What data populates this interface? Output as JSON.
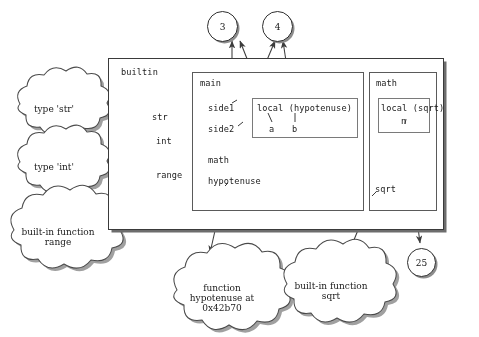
{
  "diagram": {
    "ink_color": "#1a1a1a",
    "frame_border_color": "#3a3a3a",
    "shadow_color": "#6d6d6d"
  },
  "frames": {
    "builtin": {
      "name": "builtin",
      "variables": [
        {
          "name": "str",
          "target": "type-str-cloud"
        },
        {
          "name": "int",
          "target": "type-int-cloud"
        },
        {
          "name": "range",
          "target": "builtin-function-range-cloud"
        }
      ]
    },
    "main": {
      "name": "main",
      "variables": [
        {
          "name": "side1",
          "target": "value-3"
        },
        {
          "name": "side2",
          "target": "value-4"
        },
        {
          "name": "math",
          "target": "math-frame"
        },
        {
          "name": "hypotenuse",
          "target": "function-hypotenuse-cloud"
        }
      ],
      "inner_frame": {
        "name": "local (hypotenuse)",
        "variables": [
          {
            "name": "a",
            "target": "value-3"
          },
          {
            "name": "b",
            "target": "value-4"
          }
        ]
      }
    },
    "math": {
      "name": "math",
      "variables": [
        {
          "name": "sqrt",
          "target": "builtin-function-sqrt-cloud"
        }
      ],
      "inner_frame": {
        "name": "local (sqrt)",
        "variables": [
          {
            "name": "n",
            "target": "value-25"
          }
        ]
      }
    }
  },
  "clouds": [
    {
      "id": "type-str-cloud",
      "lines": [
        "type 'str'"
      ]
    },
    {
      "id": "type-int-cloud",
      "lines": [
        "type 'int'"
      ]
    },
    {
      "id": "builtin-function-range-cloud",
      "lines": [
        "built-in function",
        "range"
      ]
    },
    {
      "id": "function-hypotenuse-cloud",
      "lines": [
        "function",
        "hypotenuse at",
        "0x42b70"
      ]
    },
    {
      "id": "builtin-function-sqrt-cloud",
      "lines": [
        "built-in function",
        "sqrt"
      ]
    }
  ],
  "values": [
    {
      "id": "value-3",
      "label": "3"
    },
    {
      "id": "value-4",
      "label": "4"
    },
    {
      "id": "value-25",
      "label": "25"
    }
  ]
}
